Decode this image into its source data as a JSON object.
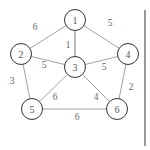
{
  "graph": {
    "nodes": [
      {
        "id": "1",
        "label": "1",
        "x": 75,
        "y": 20
      },
      {
        "id": "2",
        "label": "2",
        "x": 21,
        "y": 54
      },
      {
        "id": "3",
        "label": "3",
        "x": 75,
        "y": 67
      },
      {
        "id": "4",
        "label": "4",
        "x": 128,
        "y": 54
      },
      {
        "id": "5",
        "label": "5",
        "x": 32,
        "y": 109
      },
      {
        "id": "6",
        "label": "6",
        "x": 117,
        "y": 109
      }
    ],
    "edges": [
      {
        "from": "1",
        "to": "2",
        "weight": "6",
        "lx": 35,
        "ly": 27
      },
      {
        "from": "1",
        "to": "3",
        "weight": "1",
        "lx": 68,
        "ly": 45
      },
      {
        "from": "1",
        "to": "4",
        "weight": "5",
        "lx": 110,
        "ly": 23
      },
      {
        "from": "2",
        "to": "3",
        "weight": "5",
        "lx": 44,
        "ly": 65
      },
      {
        "from": "3",
        "to": "4",
        "weight": "5",
        "lx": 104,
        "ly": 67
      },
      {
        "from": "2",
        "to": "5",
        "weight": "3",
        "lx": 12,
        "ly": 81
      },
      {
        "from": "3",
        "to": "5",
        "weight": "6",
        "lx": 55,
        "ly": 97
      },
      {
        "from": "3",
        "to": "6",
        "weight": "4",
        "lx": 96,
        "ly": 97
      },
      {
        "from": "4",
        "to": "6",
        "weight": "2",
        "lx": 131,
        "ly": 87
      },
      {
        "from": "5",
        "to": "6",
        "weight": "6",
        "lx": 77,
        "ly": 117
      }
    ],
    "node_radius": 10.5
  }
}
